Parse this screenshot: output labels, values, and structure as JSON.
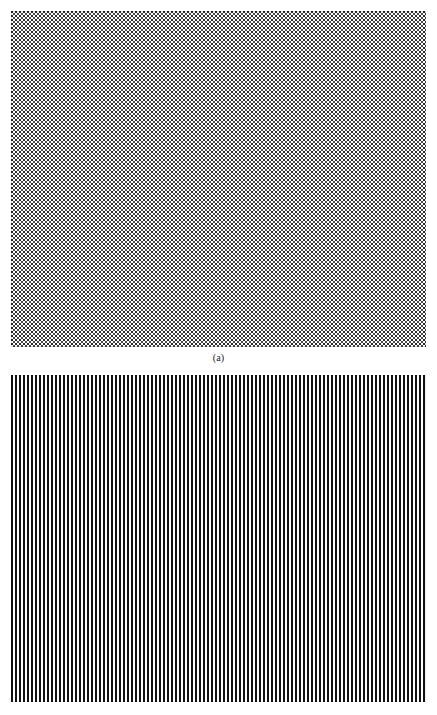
{
  "figure": {
    "background_color": "#ffffff",
    "page_width": 437,
    "page_height": 715
  },
  "panels": [
    {
      "id": "panel-a",
      "caption": "(a)",
      "pattern_name": "halftone-dot-grid",
      "description": "Uniform fine halftone dot screen filling the frame",
      "x": 11,
      "y": 11,
      "width": 415,
      "height": 336,
      "period_px": 4,
      "dot_size_px": 2,
      "tone_percent": 50,
      "ink_color": "#2b2b2b",
      "paper_color": "#ffffff"
    },
    {
      "id": "panel-b",
      "caption": "",
      "pattern_name": "vertical-line-grating",
      "description": "Vertical black and white square-wave stripe grating, cropped at page bottom",
      "x": 11,
      "y": 375,
      "width": 415,
      "height": 327,
      "period_px": 4,
      "bar_width_px": 2,
      "gap_width_px": 2,
      "stripe_count": 104,
      "ink_color": "#111111",
      "paper_color": "#ffffff"
    }
  ],
  "chart_data": {
    "type": "heatmap",
    "title": "",
    "xlabel": "",
    "ylabel": "",
    "grid": false,
    "legend": "none",
    "subplots": [
      {
        "label": "(a)",
        "type": "heatmap",
        "pattern": "checkerboard-halftone",
        "spatial_period_px": 4,
        "duty_cycle": 0.5,
        "mean_tone": 0.5,
        "values": [
          0,
          1,
          0,
          1
        ],
        "categories": [
          "ink",
          "paper",
          "ink",
          "paper"
        ]
      },
      {
        "label": "(b)",
        "type": "heatmap",
        "pattern": "vertical-square-wave-grating",
        "spatial_period_px": 4,
        "duty_cycle": 0.5,
        "mean_tone": 0.5,
        "values": [
          1,
          1,
          0,
          0
        ],
        "categories": [
          "ink",
          "ink",
          "paper",
          "paper"
        ]
      }
    ]
  }
}
